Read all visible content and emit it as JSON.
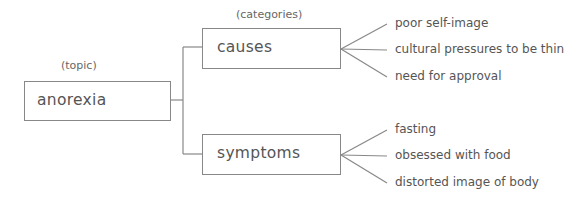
{
  "diagram": {
    "type": "tree-outline",
    "topic_label": "(topic)",
    "categories_label": "(categories)",
    "topic": "anorexia",
    "categories": [
      {
        "name": "causes",
        "items": [
          "poor self-image",
          "cultural pressures to be thin",
          "need for approval"
        ]
      },
      {
        "name": "symptoms",
        "items": [
          "fasting",
          "obsessed with food",
          "distorted image of body"
        ]
      }
    ],
    "line_color": "#888888",
    "text_color": "#555555"
  }
}
